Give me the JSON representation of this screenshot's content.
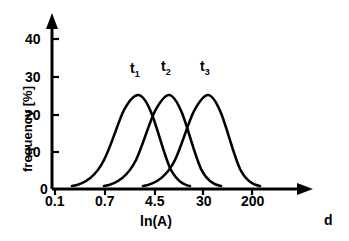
{
  "chart_data": {
    "type": "line",
    "title": "",
    "subtitle": "",
    "xlabel": "ln(A)",
    "ylabel": "frequency [%]",
    "x_tick_labels": [
      "0.1",
      "0.7",
      "4.5",
      "30",
      "200"
    ],
    "x_tick_positions_px": [
      55,
      105,
      155,
      203,
      252
    ],
    "y_tick_labels": [
      "0",
      "10",
      "20",
      "30",
      "40"
    ],
    "y_tick_values": [
      0,
      10,
      20,
      30,
      40
    ],
    "ylim": [
      0,
      45
    ],
    "grid": false,
    "legend": "inline-annotations",
    "far_right_annotation": "d",
    "series": [
      {
        "name": "t₁",
        "label": "t",
        "subscript": "1",
        "peak_value": 25,
        "peak_x_px": 137,
        "label_x_px": 130,
        "label_y_px": 60,
        "path": "M 72 186 C 86 184 96 176 104 160 C 112 144 118 122 124 110 C 130 99 134 95 138 95 C 142 95 146 100 151 112 C 157 126 163 152 170 168 C 176 180 183 185 190 186"
      },
      {
        "name": "t₂",
        "label": "t",
        "subscript": "2",
        "peak_value": 25,
        "peak_x_px": 168,
        "label_x_px": 161,
        "label_y_px": 58,
        "path": "M 104 186 C 118 184 128 176 136 160 C 143 145 149 123 155 111 C 161 100 165 95 169 95 C 173 95 177 101 182 113 C 188 128 194 153 201 169 C 207 181 214 185 221 186"
      },
      {
        "name": "t₃",
        "label": "t",
        "subscript": "3",
        "peak_value": 25,
        "peak_x_px": 207,
        "label_x_px": 200,
        "label_y_px": 58,
        "path": "M 143 186 C 157 184 167 176 175 160 C 182 145 188 123 194 111 C 200 100 204 95 208 95 C 212 95 216 101 221 113 C 227 128 233 153 240 169 C 246 181 253 185 260 186"
      }
    ]
  },
  "axes": {
    "x_axis_arrow_tip_px": 312,
    "y_axis_arrow_tip_px": 15,
    "origin_px": {
      "x": 52,
      "y": 189
    }
  }
}
